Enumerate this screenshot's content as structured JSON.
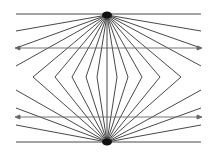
{
  "figure": {
    "type": "optical-illusion",
    "name": "Hering illusion",
    "width": 214,
    "height": 152,
    "background": "#ffffff",
    "line_color": "#333333",
    "arrow_color": "#555555",
    "top_apex": [
      107,
      15
    ],
    "bottom_apex": [
      107,
      142
    ],
    "horizontal_lines": [
      {
        "y": 14,
        "x1": 16,
        "x2": 201
      },
      {
        "y": 142,
        "x1": 16,
        "x2": 201
      }
    ],
    "arrow_lines": [
      {
        "y": 48,
        "x1": 15,
        "x2": 202
      },
      {
        "y": 117,
        "x1": 15,
        "x2": 202
      }
    ],
    "side_rays_top": [
      [
        16,
        31
      ],
      [
        16,
        48
      ],
      [
        16,
        66
      ],
      [
        201,
        31
      ],
      [
        201,
        48
      ],
      [
        201,
        66
      ]
    ],
    "side_rays_bottom": [
      [
        16,
        90
      ],
      [
        16,
        108
      ],
      [
        16,
        125
      ],
      [
        201,
        90
      ],
      [
        201,
        108
      ],
      [
        201,
        125
      ]
    ],
    "chevron_vertex_y": 77,
    "chevron_vertices_x": [
      33,
      55,
      72,
      86,
      97,
      107,
      117,
      128,
      142,
      160,
      181
    ]
  }
}
